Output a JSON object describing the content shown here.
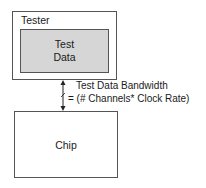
{
  "diagram": {
    "tester": {
      "label": "Tester"
    },
    "test_data": {
      "line1": "Test",
      "line2": "Data",
      "fill": "#d6d6d6"
    },
    "chip": {
      "label": "Chip"
    },
    "connection": {
      "type": "bidirectional-arrow",
      "label_line1": "Test Data Bandwidth",
      "label_line2": "= (# Channels* Clock Rate)"
    },
    "colors": {
      "border": "#555555",
      "inner_fill": "#d6d6d6",
      "background": "#ffffff"
    }
  }
}
